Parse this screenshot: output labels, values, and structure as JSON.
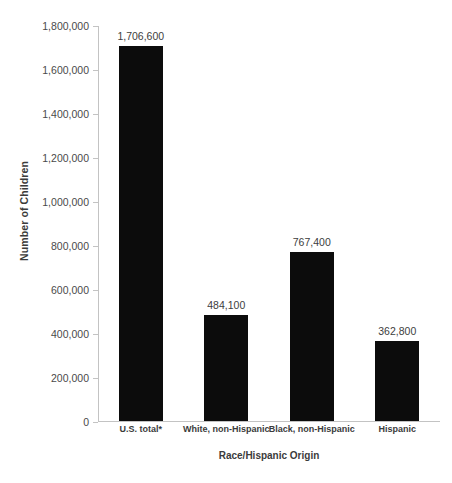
{
  "chart_data": {
    "type": "bar",
    "title": "",
    "xlabel": "Race/Hispanic Origin",
    "ylabel": "Number of Children",
    "categories": [
      "U.S. total*",
      "White, non-Hispanic",
      "Black, non-Hispanic",
      "Hispanic"
    ],
    "values": [
      1706600,
      484100,
      767400,
      362800
    ],
    "value_labels": [
      "1,706,600",
      "484,100",
      "767,400",
      "362,800"
    ],
    "ylim": [
      0,
      1800000
    ],
    "ytick_values": [
      0,
      200000,
      400000,
      600000,
      800000,
      1000000,
      1200000,
      1400000,
      1600000,
      1800000
    ],
    "ytick_labels": [
      "0",
      "200,000",
      "400,000",
      "600,000",
      "800,000",
      "1,000,000",
      "1,200,000",
      "1,400,000",
      "1,600,000",
      "1,800,000"
    ],
    "grid": false,
    "legend": "none",
    "bar_color": "#0c0c0c",
    "axis_color": "#c3c3c3",
    "background": "#ffffff"
  }
}
